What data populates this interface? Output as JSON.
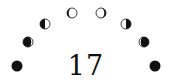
{
  "day_number": "17",
  "colors": {
    "ink": "#111111",
    "light": "#ffffff",
    "background": "#ffffff"
  },
  "moon_phases": [
    {
      "name": "new-moon",
      "cx": 17,
      "cy": 66,
      "r": 5.5,
      "phase": "new"
    },
    {
      "name": "waxing-crescent",
      "cx": 28,
      "cy": 42,
      "r": 5,
      "phase": "waxing-crescent"
    },
    {
      "name": "first-quarter",
      "cx": 45,
      "cy": 24,
      "r": 5,
      "phase": "first-quarter"
    },
    {
      "name": "waxing-gibbous",
      "cx": 72,
      "cy": 13,
      "r": 5,
      "phase": "waxing-gibbous"
    },
    {
      "name": "waning-gibbous",
      "cx": 101,
      "cy": 13,
      "r": 5,
      "phase": "waning-gibbous"
    },
    {
      "name": "last-quarter",
      "cx": 126,
      "cy": 24,
      "r": 5,
      "phase": "last-quarter"
    },
    {
      "name": "waning-crescent",
      "cx": 144,
      "cy": 42,
      "r": 5,
      "phase": "waning-crescent"
    },
    {
      "name": "new-moon-end",
      "cx": 155,
      "cy": 66,
      "r": 5.5,
      "phase": "new"
    }
  ]
}
